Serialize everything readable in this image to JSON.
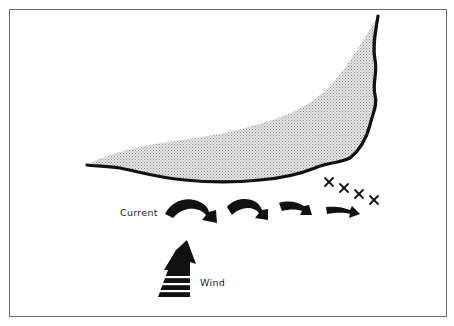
{
  "diagram": {
    "labels": {
      "current": "Current",
      "wind": "Wind"
    },
    "elements": {
      "land_mass": "stippled coastline shape",
      "current_arrows_count": 4,
      "x_marks_count": 4,
      "wind_arrow": "upward arrow with horizontal stripes"
    },
    "colors": {
      "ink": "#111111",
      "land_fill": "#cfcfcf",
      "frame": "#6e6e6e",
      "background": "#ffffff"
    }
  }
}
